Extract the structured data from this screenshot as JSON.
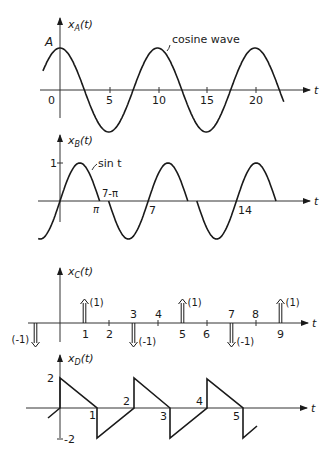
{
  "chart_data": [
    {
      "type": "line",
      "panel": "A",
      "ylabel": "x_A(t)",
      "xlabel": "t",
      "amplitude_label": "A",
      "annotation": "cosine wave",
      "function": "A cos(2πt/10)",
      "period": 10,
      "x_ticks": [
        "0",
        "5",
        "10",
        "15",
        "20"
      ]
    },
    {
      "type": "line",
      "panel": "B",
      "ylabel": "x_B(t)",
      "xlabel": "t",
      "y_tick": "1",
      "annotation": "sin t",
      "period": 7,
      "x_labels": [
        "π",
        "7-π",
        "7",
        "14"
      ]
    },
    {
      "type": "impulse",
      "panel": "C",
      "ylabel": "x_C(t)",
      "xlabel": "t",
      "x_ticks": [
        "1",
        "2",
        "3",
        "4",
        "5",
        "6",
        "7",
        "8",
        "9"
      ],
      "impulses": [
        {
          "t": -1,
          "weight": -1,
          "label": "(-1)"
        },
        {
          "t": 1,
          "weight": 1,
          "label": "(1)"
        },
        {
          "t": 3,
          "weight": -1,
          "label": "(-1)"
        },
        {
          "t": 5,
          "weight": 1,
          "label": "(1)"
        },
        {
          "t": 7,
          "weight": -1,
          "label": "(-1)"
        },
        {
          "t": 9,
          "weight": 1,
          "label": "(1)"
        }
      ]
    },
    {
      "type": "line",
      "panel": "D",
      "ylabel": "x_D(t)",
      "xlabel": "t",
      "y_ticks": [
        "2",
        "-2"
      ],
      "x_labels": [
        "1",
        "2",
        "3",
        "4",
        "5"
      ],
      "description": "sawtooth alternating: falls 2→0 on [0,1], jumps to -2, rises -2→0 on [1,2], jumps to 2, repeats"
    }
  ],
  "labels": {
    "a_ylabel_main": "x",
    "a_ylabel_sub": "A",
    "a_ylabel_arg": "(t)",
    "a_amp": "A",
    "a_annot": "cosine wave",
    "a_ticks": [
      "0",
      "5",
      "10",
      "15",
      "20"
    ],
    "t": "t",
    "b_ylabel_sub": "B",
    "b_one": "1",
    "b_annot": "sin t",
    "b_pi": "π",
    "b_7pi": "7-π",
    "b_7": "7",
    "b_14": "14",
    "c_ylabel_sub": "C",
    "c_ticks": [
      "1",
      "2",
      "3",
      "4",
      "5",
      "6",
      "7",
      "8",
      "9"
    ],
    "c_pos": "(1)",
    "c_neg": "(-1)",
    "d_ylabel_sub": "D",
    "d_two": "2",
    "d_neg_two": "-2",
    "d_ticks": [
      "1",
      "2",
      "3",
      "4",
      "5"
    ]
  }
}
